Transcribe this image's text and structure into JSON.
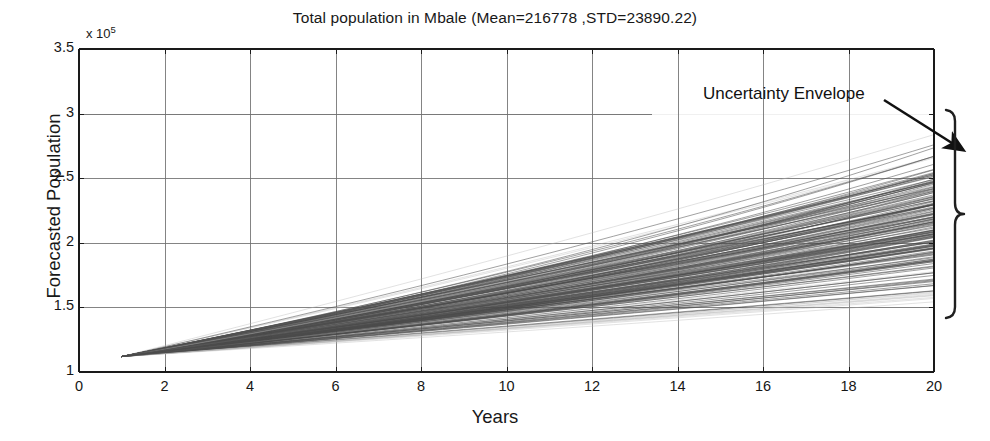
{
  "chart_data": {
    "type": "line",
    "title": "Total population in Mbale (Mean=216778 ,STD=23890.22)",
    "xlabel": "Years",
    "ylabel": "Forecasted Population",
    "y_exponent_mantissa": "x 10",
    "y_exponent_power": "5",
    "y_scale_factor": 100000,
    "xlim": [
      0,
      20
    ],
    "ylim": [
      1,
      3.5
    ],
    "xticks": [
      0,
      2,
      4,
      6,
      8,
      10,
      12,
      14,
      16,
      18,
      20
    ],
    "xtick_labels": [
      "0",
      "2",
      "4",
      "6",
      "8",
      "10",
      "12",
      "14",
      "16",
      "18",
      "20"
    ],
    "yticks": [
      1,
      1.5,
      2,
      2.5,
      3,
      3.5
    ],
    "ytick_labels": [
      "1",
      "1.5",
      "2",
      "2.5",
      "3",
      "3.5"
    ],
    "grid": true,
    "legend": "none",
    "series_count": 200,
    "series_description": "Monte-Carlo forecast trajectories of total population",
    "x_start": 1,
    "x_end": 20,
    "y_start_value": 1.12,
    "y_end_min": 1.47,
    "y_end_max": 2.95,
    "y_end_dense_min": 1.62,
    "y_end_dense_max": 2.78,
    "mean_end_value": 2.17,
    "mean": 216778,
    "std": 23890.22,
    "annotations": [
      {
        "text": "Uncertainty Envelope",
        "text_x": 703,
        "text_y": 84,
        "arrow_from_x": 884,
        "arrow_from_y": 100,
        "arrow_to_x": 963,
        "arrow_to_y": 150,
        "brace_x": 955,
        "brace_top_y": 110,
        "brace_bottom_y": 318
      }
    ],
    "colors": {
      "axis": "#1a1a1a",
      "grid": "#7a7a7a",
      "series": "#4a4a4a",
      "series_light": "#b4b4b4",
      "annotation": "#111111",
      "background": "#ffffff"
    }
  }
}
